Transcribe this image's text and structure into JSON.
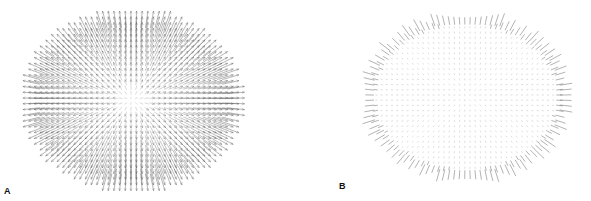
{
  "figure": {
    "panels": [
      {
        "id": "A",
        "label": "A",
        "type": "radial-vector-field",
        "description": "Dense radial vector field within elliptical region; vector length increases with distance from center",
        "center": [
          132,
          100
        ],
        "radius": [
          105,
          85
        ],
        "grid_spacing": 5.2,
        "max_length": 16,
        "stroke_color": "#555555"
      },
      {
        "id": "B",
        "label": "B",
        "type": "boundary-vector-field",
        "description": "Grid of near-zero vectors (dots) within elliptical region; short radial vectors only at boundary",
        "center": [
          466,
          97
        ],
        "radius": [
          100,
          80
        ],
        "grid_spacing": 5.2,
        "boundary_length": 10,
        "stroke_color": "#555555",
        "dot_color": "#aaaaaa"
      }
    ]
  }
}
